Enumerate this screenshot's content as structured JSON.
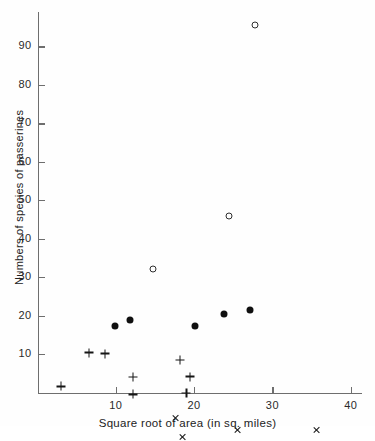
{
  "chart_data": {
    "type": "scatter",
    "title": "",
    "xlabel": "Square root of area (in sq. miles)",
    "ylabel": "Numbers of species of passerines",
    "xlim": [
      0,
      42.5
    ],
    "ylim": [
      0,
      97
    ],
    "grid": false,
    "legend": "none",
    "xticks": [
      10,
      20,
      30,
      40
    ],
    "xtick_labels": [
      "10",
      "20",
      "30",
      "40"
    ],
    "yticks": [
      10,
      20,
      30,
      40,
      50,
      60,
      70,
      80,
      90
    ],
    "ytick_labels": [
      "10",
      "20",
      "30",
      "40",
      "50",
      "60",
      "70",
      "80",
      "90"
    ],
    "series": [
      {
        "name": "open-circle",
        "marker": "open-circle",
        "points": [
          {
            "x": 14.7,
            "y": 32.0
          },
          {
            "x": 24.5,
            "y": 45.8
          },
          {
            "x": 27.8,
            "y": 95.5
          }
        ]
      },
      {
        "name": "filled-circle",
        "marker": "filled-circle",
        "points": [
          {
            "x": 9.9,
            "y": 17.4
          },
          {
            "x": 11.8,
            "y": 18.8
          },
          {
            "x": 20.1,
            "y": 17.2
          },
          {
            "x": 23.8,
            "y": 20.3
          },
          {
            "x": 27.2,
            "y": 21.5
          }
        ]
      },
      {
        "name": "plus",
        "marker": "plus",
        "points": [
          {
            "x": 3.0,
            "y": 1.6
          },
          {
            "x": 6.6,
            "y": 12.7
          },
          {
            "x": 8.6,
            "y": 14.8
          },
          {
            "x": 12.2,
            "y": 11.0
          },
          {
            "x": 12.2,
            "y": 8.9
          },
          {
            "x": 18.2,
            "y": 20.2
          },
          {
            "x": 19.5,
            "y": 18.2
          },
          {
            "x": 19.0,
            "y": 16.3
          }
        ]
      },
      {
        "name": "cross",
        "marker": "cross",
        "points": [
          {
            "x": 17.6,
            "y": 12.2
          },
          {
            "x": 18.6,
            "y": 9.3
          },
          {
            "x": 25.6,
            "y": 13.2
          },
          {
            "x": 35.7,
            "y": 15.2
          }
        ]
      }
    ]
  },
  "axis": {
    "x_title": "Square root of area (in sq. miles)",
    "y_title": "Numbers of species of passerines"
  },
  "colors": {
    "axis": "#6e6e6e",
    "marker": "#101010",
    "background": "#ffffff"
  }
}
